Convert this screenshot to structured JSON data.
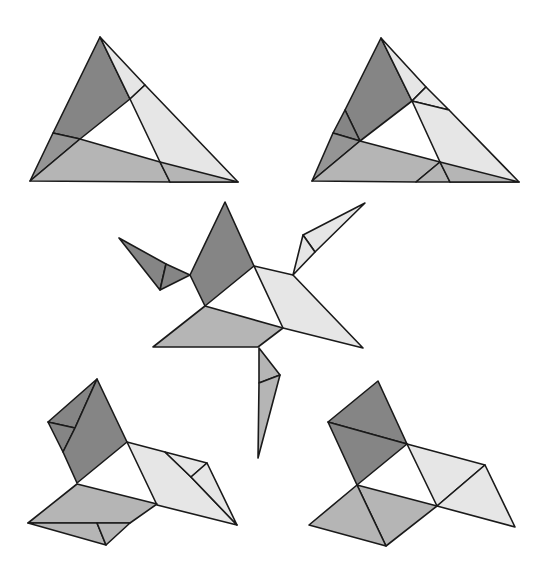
{
  "diagram": {
    "colors": {
      "dark": "#858585",
      "dark_alt": "#959595",
      "medium": "#b5b5b5",
      "light": "#e6e6e6",
      "stroke": "#1a1a1a",
      "background": "#ffffff"
    },
    "figures": [
      {
        "name": "triangle-top-left",
        "pieces": [
          {
            "shade": "dark",
            "points": "100,37 130,99 80,139 53,133"
          },
          {
            "shade": "dark_alt",
            "points": "53,133 80,139 30,181"
          },
          {
            "shade": "light",
            "points": "100,37 145,85 130,99"
          },
          {
            "shade": "light",
            "points": "130,99 145,85 238,182 170,182 160,162"
          },
          {
            "shade": "medium",
            "points": "80,139 160,162 170,182 30,181"
          },
          {
            "shade": "medium",
            "points": "160,162 238,182 170,182"
          }
        ]
      },
      {
        "name": "triangle-top-right",
        "pieces": [
          {
            "shade": "dark",
            "points": "381,38 412,101 360,141 345,110"
          },
          {
            "shade": "dark",
            "points": "345,110 360,141 333,133"
          },
          {
            "shade": "dark_alt",
            "points": "333,133 360,141 312,181"
          },
          {
            "shade": "light",
            "points": "381,38 426,87 412,101"
          },
          {
            "shade": "light",
            "points": "412,101 426,87 449,110"
          },
          {
            "shade": "light",
            "points": "412,101 449,110 519,182 450,182 440,162"
          },
          {
            "shade": "medium",
            "points": "360,141 440,162 416,182 312,181"
          },
          {
            "shade": "medium",
            "points": "440,162 450,182 416,182"
          },
          {
            "shade": "medium",
            "points": "440,162 519,182 450,182"
          }
        ]
      },
      {
        "name": "creature-middle",
        "pieces": [
          {
            "shade": "dark",
            "points": "119,238 166,264 160,290"
          },
          {
            "shade": "dark",
            "points": "166,264 190,275 160,290"
          },
          {
            "shade": "dark",
            "points": "225,202 254,266 205,306 190,275"
          },
          {
            "shade": "light",
            "points": "254,266 293,275 363,348 283,328"
          },
          {
            "shade": "light",
            "points": "303,235 365,203 315,252"
          },
          {
            "shade": "light",
            "points": "303,235 315,252 293,275"
          },
          {
            "shade": "medium",
            "points": "205,306 283,328 258,347 153,347"
          },
          {
            "shade": "medium",
            "points": "259,348 280,375 259,383"
          },
          {
            "shade": "medium",
            "points": "259,383 280,375 258,458"
          }
        ]
      },
      {
        "name": "figure-bottom-left",
        "pieces": [
          {
            "shade": "dark",
            "points": "97,379 75,428 48,422"
          },
          {
            "shade": "dark",
            "points": "48,422 75,428 63,452"
          },
          {
            "shade": "dark",
            "points": "97,379 127,442 77,483 63,452 75,428"
          },
          {
            "shade": "light",
            "points": "127,442 165,452 191,477 237,525 157,505"
          },
          {
            "shade": "light",
            "points": "165,452 207,463 191,477"
          },
          {
            "shade": "light",
            "points": "207,463 237,525 191,477"
          },
          {
            "shade": "medium",
            "points": "77,484 157,504 130,523 28,523"
          },
          {
            "shade": "medium",
            "points": "28,523 97,523 106,545"
          },
          {
            "shade": "medium",
            "points": "97,523 130,523 106,545"
          }
        ]
      },
      {
        "name": "figure-bottom-right",
        "pieces": [
          {
            "shade": "dark",
            "points": "378,381 407,444 328,422"
          },
          {
            "shade": "dark",
            "points": "328,422 407,444 357,485"
          },
          {
            "shade": "light",
            "points": "407,444 485,465 437,506"
          },
          {
            "shade": "light",
            "points": "485,465 515,527 437,506"
          },
          {
            "shade": "medium",
            "points": "357,485 437,506 386,546"
          },
          {
            "shade": "medium",
            "points": "357,485 386,546 309,525"
          }
        ]
      }
    ]
  }
}
